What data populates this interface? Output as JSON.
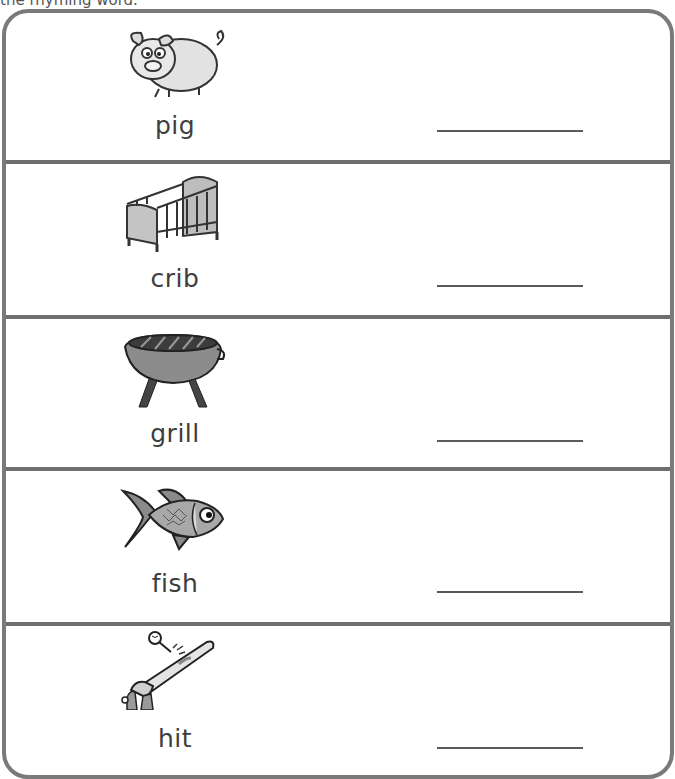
{
  "worksheet": {
    "instructions": "the rhyming word.",
    "items": [
      {
        "word": "pig",
        "picture": "pig-icon"
      },
      {
        "word": "crib",
        "picture": "crib-icon"
      },
      {
        "word": "grill",
        "picture": "grill-icon"
      },
      {
        "word": "fish",
        "picture": "fish-icon"
      },
      {
        "word": "hit",
        "picture": "bat-hitting-ball-icon"
      }
    ],
    "colors": {
      "border": "#7a7a7a",
      "divider": "#6e6e6e",
      "text": "#3d3d3d"
    }
  }
}
